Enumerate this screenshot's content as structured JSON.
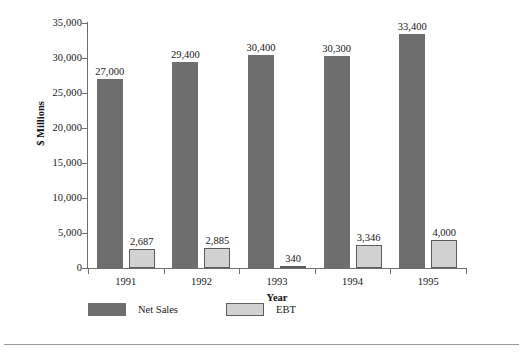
{
  "chart_data": {
    "type": "bar",
    "title": "",
    "xlabel": "Year",
    "ylabel": "$ Millions",
    "categories": [
      "1991",
      "1992",
      "1993",
      "1994",
      "1995"
    ],
    "series": [
      {
        "name": "Net Sales",
        "color": "#6e6e6e",
        "values": [
          27000,
          29400,
          30400,
          30300,
          33400
        ],
        "labels": [
          "27,000",
          "29,400",
          "30,400",
          "30,300",
          "33,400"
        ]
      },
      {
        "name": "EBT",
        "color": "#d2d2d2",
        "values": [
          2687,
          2885,
          340,
          3346,
          4000
        ],
        "labels": [
          "2,687",
          "2,885",
          "340",
          "3,346",
          "4,000"
        ]
      }
    ],
    "ylim": [
      0,
      35000
    ],
    "yticks": [
      0,
      5000,
      10000,
      15000,
      20000,
      25000,
      30000,
      35000
    ],
    "ytick_labels": [
      "0",
      "5,000",
      "10,000",
      "15,000",
      "20,000",
      "25,000",
      "30,000",
      "35,000"
    ],
    "grid": false,
    "legend_position": "bottom-left"
  },
  "axes": {
    "y_title": "$ Millions",
    "x_title": "Year"
  },
  "legend": {
    "items": [
      {
        "label": "Net Sales",
        "color": "#6e6e6e"
      },
      {
        "label": "EBT",
        "color": "#d2d2d2"
      }
    ]
  }
}
